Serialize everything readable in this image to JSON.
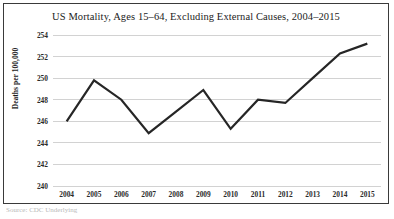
{
  "figure": {
    "caption_fragment": "Source: CDC Underlying"
  },
  "chart_data": {
    "type": "line",
    "title": "US Mortality, Ages 15–64, Excluding External Causes, 2004–2015",
    "xlabel": "",
    "ylabel": "Deaths per 100,000",
    "categories": [
      "2004",
      "2005",
      "2006",
      "2007",
      "2008",
      "2009",
      "2010",
      "2011",
      "2012",
      "2013",
      "2014",
      "2015"
    ],
    "values": [
      246.0,
      249.8,
      248.0,
      244.9,
      246.9,
      248.9,
      245.3,
      248.0,
      247.7,
      250.0,
      252.3,
      253.2
    ],
    "series": [
      {
        "name": "Deaths per 100,000",
        "values": [
          246.0,
          249.8,
          248.0,
          244.9,
          246.9,
          248.9,
          245.3,
          248.0,
          247.7,
          250.0,
          252.3,
          253.2
        ],
        "color": "#262626"
      }
    ],
    "ylim": [
      240,
      254
    ],
    "ytick_step": 2,
    "yticks": [
      240,
      242,
      244,
      246,
      248,
      250,
      252,
      254
    ],
    "grid": true,
    "grid_color": "#d2d2d2",
    "legend": "none",
    "line_width": 2.2
  }
}
